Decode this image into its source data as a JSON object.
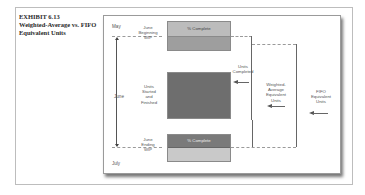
{
  "exhibit": {
    "number": "EXHIBIT 6.13",
    "title_line1": "Weighted-Average vs. FIFO",
    "title_line2": "Equivalent Units"
  },
  "months": {
    "top": "May",
    "middle": "June",
    "bottom": "July"
  },
  "left_labels": {
    "beginning_wip": [
      "June",
      "Beginning",
      "WIP"
    ],
    "started_finished": [
      "Units",
      "Started",
      "and",
      "Finished"
    ],
    "ending_wip": [
      "June",
      "Ending",
      "WIP"
    ]
  },
  "boxes": {
    "beginning_wip_header": "% Complete",
    "ending_wip_header": "% Complete"
  },
  "right_labels": {
    "units_completed": [
      "Units",
      "Completed"
    ],
    "weighted_average": [
      "Weighted-",
      "Average",
      "Equivalent",
      "Units"
    ],
    "fifo": [
      "FIFO",
      "Equivalent",
      "Units"
    ]
  },
  "colors": {
    "beginning_header_fill": "#b8b8b8",
    "beginning_body_fill": "#9e9e9e",
    "started_finished_fill": "#6e6e6e",
    "ending_header_fill": "#7a7a7a",
    "ending_body_fill": "#c9c9c9"
  }
}
